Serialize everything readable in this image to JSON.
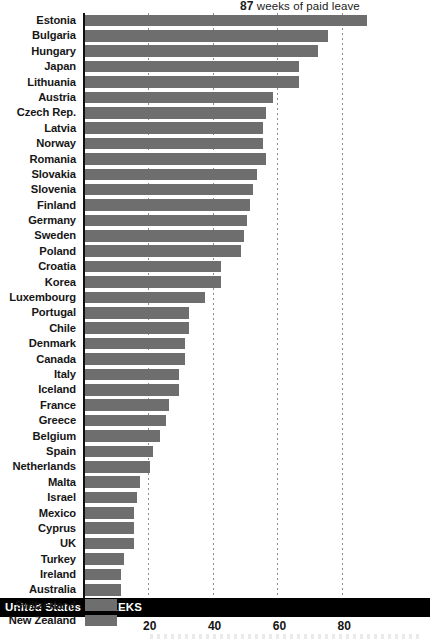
{
  "annotation": {
    "value": "87",
    "text": "weeks of paid leave"
  },
  "highlight": {
    "label": "United States",
    "value": "0 WEEKS"
  },
  "axis": {
    "ticks": [
      "20",
      "40",
      "60",
      "80"
    ],
    "tick_values": [
      20,
      40,
      60,
      80
    ]
  },
  "chart_data": {
    "type": "bar",
    "orientation": "horizontal",
    "title": "",
    "subtitle": "",
    "xlabel": "WEEKS",
    "ylabel": "",
    "xlim": [
      0,
      92
    ],
    "grid": true,
    "legend": "none",
    "units": "weeks of paid leave",
    "annotations": [
      {
        "text": "87 weeks of paid leave",
        "target": "Estonia",
        "value": 87
      }
    ],
    "highlight_row": {
      "category": "United States",
      "value": 0,
      "label": "0 WEEKS"
    },
    "categories": [
      "Estonia",
      "Bulgaria",
      "Hungary",
      "Japan",
      "Lithuania",
      "Austria",
      "Czech Rep.",
      "Latvia",
      "Norway",
      "Romania",
      "Slovakia",
      "Slovenia",
      "Finland",
      "Germany",
      "Sweden",
      "Poland",
      "Croatia",
      "Korea",
      "Luxembourg",
      "Portugal",
      "Chile",
      "Denmark",
      "Canada",
      "Italy",
      "Iceland",
      "France",
      "Greece",
      "Belgium",
      "Spain",
      "Netherlands",
      "Malta",
      "Israel",
      "Mexico",
      "Cyprus",
      "UK",
      "Turkey",
      "Ireland",
      "Australia",
      "Switzerland",
      "New Zealand",
      "United States"
    ],
    "values": [
      87,
      75,
      72,
      66,
      66,
      58,
      56,
      55,
      55,
      56,
      53,
      52,
      51,
      50,
      49,
      48,
      42,
      42,
      37,
      32,
      32,
      31,
      31,
      29,
      29,
      26,
      25,
      23,
      21,
      20,
      17,
      16,
      15,
      15,
      15,
      12,
      11,
      11,
      10,
      10,
      0
    ]
  },
  "colors": {
    "bar": "#6e6e6e",
    "axis": "#101010",
    "highlight_band": "#000000",
    "highlight_text": "#ffffff",
    "gridline": "#8d8d8d",
    "background": "#ffffff"
  }
}
